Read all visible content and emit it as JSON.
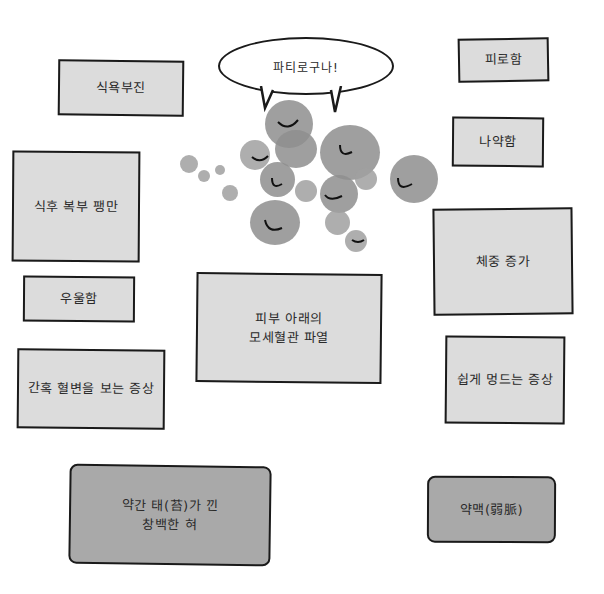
{
  "speech_bubble": {
    "text": "파티로구나!"
  },
  "symptoms": {
    "appetite_loss": "식욕부진",
    "fatigue": "피로함",
    "weakness": "나약함",
    "bloating": "식후 복부 팽만",
    "weight_gain": "체중 증가",
    "depression": "우울함",
    "capillary_rupture": "피부 아래의\n모세혈관 파열",
    "easy_bruising": "쉽게 멍드는 증상",
    "spotting": "간혹 혈변을 보는 증상",
    "pale_tongue": "약간 태(苔)가 낀\n창백한 혀",
    "weak_pulse": "약맥(弱脈)"
  },
  "colors": {
    "box_fill": "#dcdcdc",
    "box_fill_dark": "#a9a9a9",
    "outline": "#1a1a1a",
    "blob": "#8e8e8e"
  }
}
